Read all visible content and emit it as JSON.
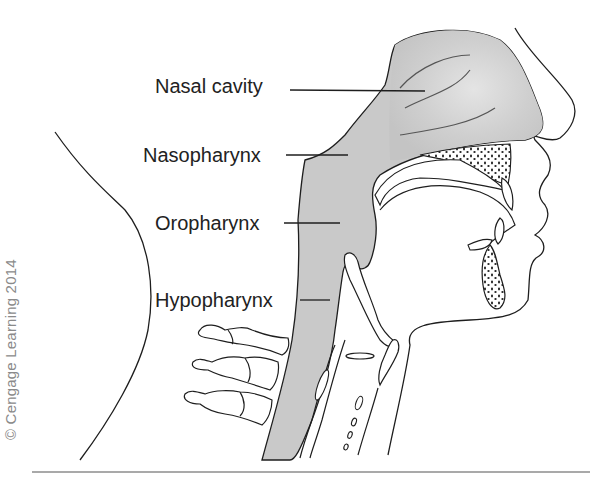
{
  "figure": {
    "labels": [
      {
        "id": "nasal-cavity",
        "text": "Nasal cavity"
      },
      {
        "id": "nasopharynx",
        "text": "Nasopharynx"
      },
      {
        "id": "oropharynx",
        "text": "Oropharynx"
      },
      {
        "id": "hypopharynx",
        "text": "Hypopharynx"
      }
    ],
    "copyright": "© Cengage Learning 2014",
    "colors": {
      "airway_fill": "#c9c9c9",
      "outline": "#1e1e1e",
      "text": "#222222",
      "copyright": "#8a8a8a",
      "rule": "#8c8c8c"
    }
  }
}
